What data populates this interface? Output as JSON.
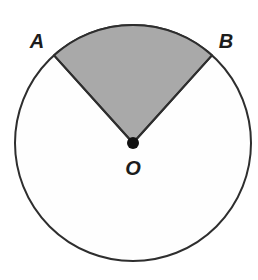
{
  "figure": {
    "background_color": "#ffffff"
  },
  "geometry": {
    "circle": {
      "center_x": 133,
      "center_y": 143,
      "radius": 118,
      "stroke_color": "#2e2e2e",
      "stroke_width": 2,
      "fill_color": "#fefefe"
    },
    "center_dot": {
      "center_x": 133,
      "center_y": 143,
      "radius": 6,
      "fill_color": "#111111"
    },
    "sector": {
      "fill_color": "#a9a9a9",
      "stroke_color": "#2e2e2e",
      "stroke_width": 2,
      "start_angle_deg": 48,
      "end_angle_deg": 132,
      "central_angle_deg": 84,
      "point_a_x": 54,
      "point_a_y": 55,
      "point_b_x": 212,
      "point_b_y": 55,
      "path": "M 133 143 L 54 55 A 118 118 0 0 1 212 55 Z"
    }
  },
  "labels": {
    "point_a": {
      "text": "A",
      "x": 37,
      "y": 48
    },
    "point_b": {
      "text": "B",
      "x": 226,
      "y": 48
    },
    "center_o": {
      "text": "O",
      "x": 133,
      "y": 175
    }
  }
}
